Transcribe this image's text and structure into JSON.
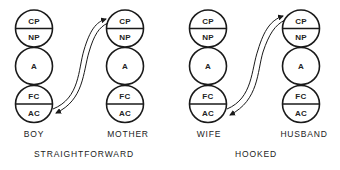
{
  "diagrams": [
    {
      "caption": "STRAIGHTFORWARD",
      "left": {
        "label": "BOY",
        "states": {
          "cp": "CP",
          "np": "NP",
          "a": "A",
          "fc": "FC",
          "ac": "AC"
        }
      },
      "right": {
        "label": "MOTHER",
        "states": {
          "cp": "CP",
          "np": "NP",
          "a": "A",
          "fc": "FC",
          "ac": "AC"
        }
      },
      "transaction": "AC to CP and CP to AC"
    },
    {
      "caption": "HOOKED",
      "left": {
        "label": "WIFE",
        "states": {
          "cp": "CP",
          "np": "NP",
          "a": "A",
          "fc": "FC",
          "ac": "AC"
        }
      },
      "right": {
        "label": "HUSBAND",
        "states": {
          "cp": "CP",
          "np": "NP",
          "a": "A",
          "fc": "FC",
          "ac": "AC"
        }
      },
      "transaction": "AC to CP and CP to AC"
    }
  ],
  "colors": {
    "stroke": "#1a1a1a",
    "background": "#ffffff"
  }
}
